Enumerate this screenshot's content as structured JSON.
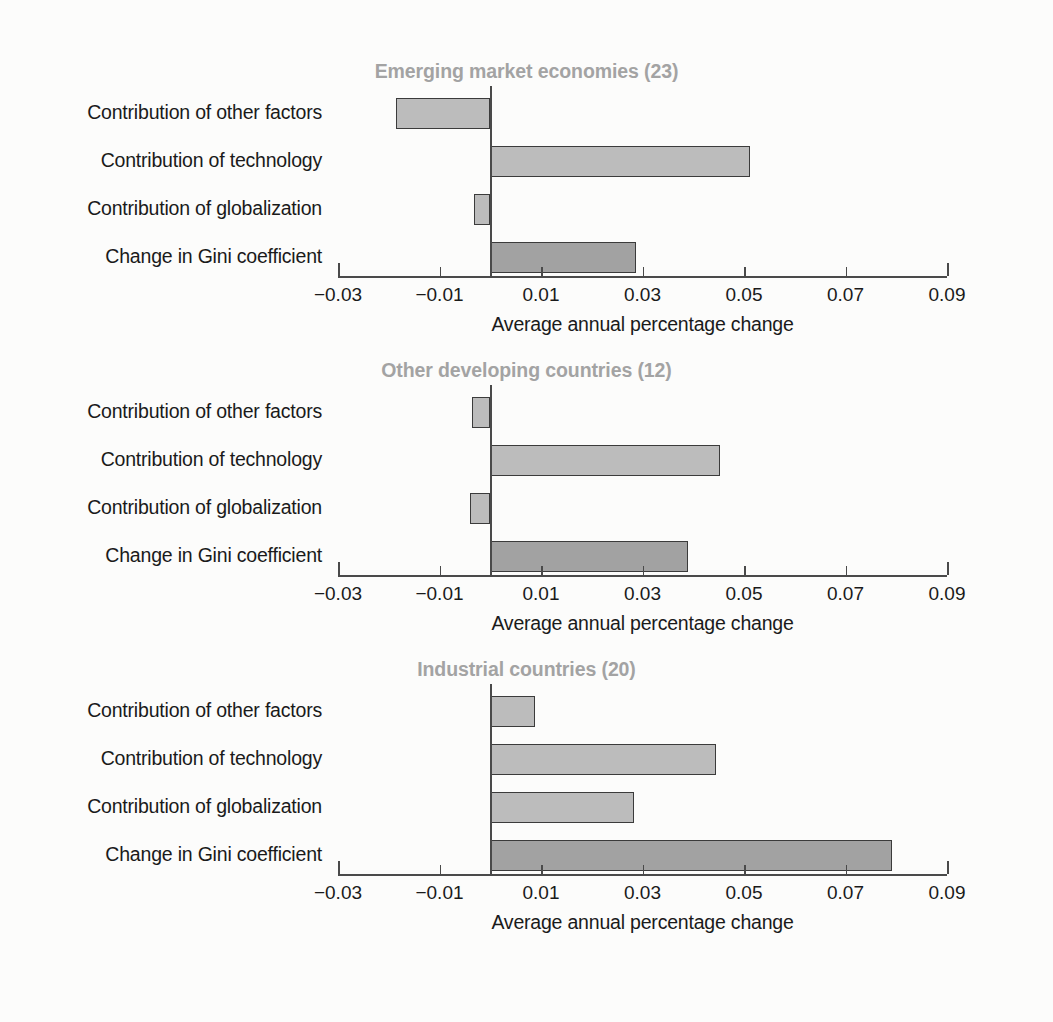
{
  "chart_data": [
    {
      "type": "bar",
      "orientation": "horizontal",
      "title": "Emerging market economies (23)",
      "xlabel": "Average annual percentage change",
      "ylabel": "",
      "categories": [
        "Contribution of other factors",
        "Contribution of technology",
        "Contribution of globalization",
        "Change in Gini coefficient"
      ],
      "values": [
        -0.0185,
        0.0512,
        -0.0033,
        0.0288
      ],
      "bar_styles": [
        "light",
        "light",
        "light",
        "dark"
      ],
      "xlim": [
        -0.03,
        0.09
      ],
      "xticks": [
        -0.03,
        -0.01,
        0.01,
        0.03,
        0.05,
        0.07,
        0.09
      ],
      "xticklabels": [
        "−0.03",
        "−0.01",
        "0.01",
        "0.03",
        "0.05",
        "0.07",
        "0.09"
      ],
      "grid": false,
      "legend": "none"
    },
    {
      "type": "bar",
      "orientation": "horizontal",
      "title": "Other developing countries (12)",
      "xlabel": "Average annual percentage change",
      "ylabel": "",
      "categories": [
        "Contribution of other factors",
        "Contribution of technology",
        "Contribution of globalization",
        "Change in Gini coefficient"
      ],
      "values": [
        -0.0035,
        0.0453,
        -0.004,
        0.039
      ],
      "bar_styles": [
        "light",
        "light",
        "light",
        "dark"
      ],
      "xlim": [
        -0.03,
        0.09
      ],
      "xticks": [
        -0.03,
        -0.01,
        0.01,
        0.03,
        0.05,
        0.07,
        0.09
      ],
      "xticklabels": [
        "−0.03",
        "−0.01",
        "0.01",
        "0.03",
        "0.05",
        "0.07",
        "0.09"
      ],
      "grid": false,
      "legend": "none"
    },
    {
      "type": "bar",
      "orientation": "horizontal",
      "title": "Industrial countries (20)",
      "xlabel": "Average annual percentage change",
      "ylabel": "",
      "categories": [
        "Contribution of other factors",
        "Contribution of technology",
        "Contribution of globalization",
        "Change in Gini coefficient"
      ],
      "values": [
        0.0089,
        0.0445,
        0.0284,
        0.0792
      ],
      "bar_styles": [
        "light",
        "light",
        "light",
        "dark"
      ],
      "xlim": [
        -0.03,
        0.09
      ],
      "xticks": [
        -0.03,
        -0.01,
        0.01,
        0.03,
        0.05,
        0.07,
        0.09
      ],
      "xticklabels": [
        "−0.03",
        "−0.01",
        "0.01",
        "0.03",
        "0.05",
        "0.07",
        "0.09"
      ],
      "grid": false,
      "legend": "none"
    }
  ],
  "style": {
    "title_color": "#a3a3a3",
    "bar_light_color": "#bcbcbc",
    "bar_dark_color": "#a2a2a2",
    "bar_edge_color": "#3b3b3b",
    "axis_color": "#4a4a4a",
    "text_color": "#1a1a1a",
    "background_color": "#fcfcfb"
  }
}
